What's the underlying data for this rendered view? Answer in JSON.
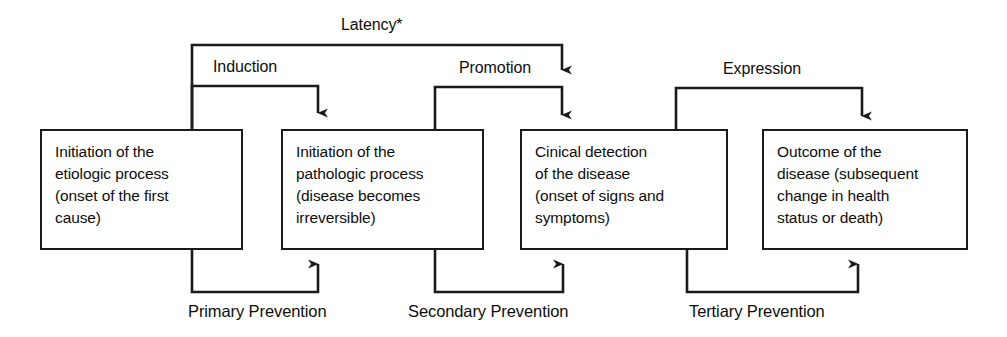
{
  "diagram": {
    "line_color": "#1a1a1a",
    "text_color": "#0d0d0d",
    "background": "#ffffff",
    "stages": [
      {
        "id": "etiologic",
        "text": "Initiation of the\netiologic process\n(onset of the first\ncause)"
      },
      {
        "id": "pathologic",
        "text": "Initiation of the\npathologic process\n(disease becomes\nirreversible)"
      },
      {
        "id": "clinical-detection",
        "text": "Cinical detection\nof the disease\n(onset of signs and\nsymptoms)"
      },
      {
        "id": "outcome",
        "text": "Outcome of the\ndisease (subsequent\nchange in health\nstatus or death)"
      }
    ],
    "interval_labels": [
      {
        "id": "latency",
        "text": "Latency*"
      },
      {
        "id": "induction",
        "text": "Induction"
      },
      {
        "id": "promotion",
        "text": "Promotion"
      },
      {
        "id": "expression",
        "text": "Expression"
      }
    ],
    "prevention_labels": [
      {
        "id": "primary",
        "text": "Primary Prevention"
      },
      {
        "id": "secondary",
        "text": "Secondary Prevention"
      },
      {
        "id": "tertiary",
        "text": "Tertiary Prevention"
      }
    ]
  }
}
